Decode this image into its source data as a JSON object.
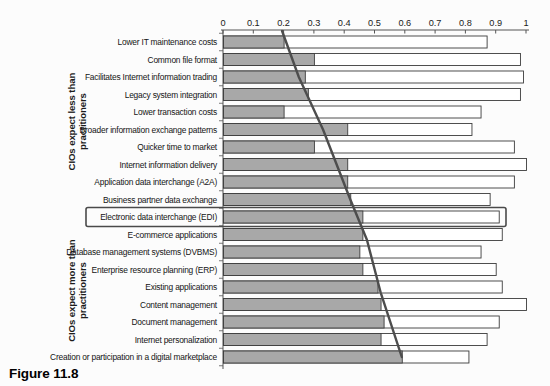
{
  "figure_caption": "Figure 11.8",
  "group_labels": {
    "top": {
      "line1": "CIOs expect less than",
      "line2": "practitioners"
    },
    "bottom": {
      "line1": "CIOs expect more than",
      "line2": "practitioners"
    }
  },
  "chart_data": {
    "type": "bar",
    "orientation": "horizontal",
    "title": "",
    "xlabel": "",
    "ylabel": "",
    "xlim": [
      0,
      1
    ],
    "grid": false,
    "legend": "none",
    "x_tick_labels": [
      "0",
      "0.1",
      "0.2",
      "0.3",
      "0.4",
      "0.5",
      "0.6",
      "0.7",
      "0.8",
      "0.9",
      "1"
    ],
    "categories": [
      "Lower IT maintenance costs",
      "Common file format",
      "Facilitates Internet information trading",
      "Legacy system integration",
      "Lower transaction costs",
      "Broader information exchange patterns",
      "Quicker time to market",
      "Internet information delivery",
      "Application data interchange (A2A)",
      "Business partner data exchange",
      "Electronic data interchange (EDI)",
      "E-commerce applications",
      "Database management systems (DVBMS)",
      "Enterprise resource planning (ERP)",
      "Existing applications",
      "Content management",
      "Document management",
      "Internet personalization",
      "Creation or participation in a digital marketplace"
    ],
    "series": [
      {
        "name": "gray_bar",
        "fill": "#a8a8a8",
        "values": [
          0.2,
          0.3,
          0.27,
          0.28,
          0.2,
          0.41,
          0.3,
          0.41,
          0.41,
          0.42,
          0.46,
          0.46,
          0.45,
          0.46,
          0.51,
          0.52,
          0.53,
          0.52,
          0.59
        ]
      },
      {
        "name": "white_bar",
        "fill": "#ffffff",
        "values": [
          0.87,
          0.98,
          0.99,
          0.98,
          0.85,
          0.82,
          0.96,
          1.0,
          0.96,
          0.88,
          0.91,
          0.92,
          0.85,
          0.9,
          0.92,
          1.0,
          0.91,
          0.87,
          0.81
        ]
      }
    ],
    "highlighted_category": "Electronic data interchange (EDI)",
    "groups": [
      {
        "label": "CIOs expect less than practitioners",
        "category_rows": [
          1,
          10
        ]
      },
      {
        "label": "CIOs expect more than practitioners",
        "category_rows": [
          11,
          19
        ]
      }
    ],
    "trend_line": {
      "color": "#4d4d4d",
      "points": [
        {
          "value": 0.195,
          "row": 0.37
        },
        {
          "value": 0.25,
          "row": 3
        },
        {
          "value": 0.33,
          "row": 6
        },
        {
          "value": 0.42,
          "row": 10
        },
        {
          "value": 0.475,
          "row": 12.3
        },
        {
          "value": 0.52,
          "row": 15.3
        },
        {
          "value": 0.59,
          "row": 19
        }
      ]
    }
  }
}
